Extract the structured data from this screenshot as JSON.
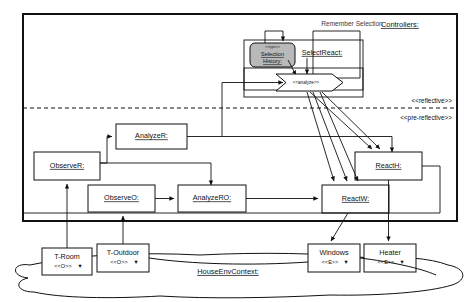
{
  "diagram": {
    "frames": [
      {
        "id": "controllers",
        "label": "Controllers:"
      },
      {
        "id": "house_env",
        "label": "HouseEnvContext:"
      }
    ],
    "layer_labels": [
      {
        "id": "reflective",
        "label": "<<reflective>>"
      },
      {
        "id": "pre_reflective",
        "label": "<<pre-reflective>>"
      }
    ],
    "notes": [
      {
        "id": "remember_selection",
        "label": "Remember Selection"
      }
    ],
    "nodes": [
      {
        "id": "select_react",
        "label": "SelectReact:",
        "stereotype": "",
        "kind": "component"
      },
      {
        "id": "selection_history",
        "label": "Selection History:",
        "line1": "Selection",
        "line2": "History:",
        "stereotype": "<<type>>",
        "kind": "datastore"
      },
      {
        "id": "analyze",
        "label": "<<analyze>>",
        "kind": "arrow-stereotype"
      },
      {
        "id": "analyze_r",
        "label": "AnalyzeR:",
        "kind": "component"
      },
      {
        "id": "observe_r",
        "label": "ObserveR:",
        "kind": "component"
      },
      {
        "id": "observe_o",
        "label": "ObserveO:",
        "kind": "component"
      },
      {
        "id": "analyze_ro",
        "label": "AnalyzeRO:",
        "kind": "component"
      },
      {
        "id": "react_h",
        "label": "ReactH:",
        "kind": "component"
      },
      {
        "id": "react_w",
        "label": "ReactW:",
        "kind": "component"
      },
      {
        "id": "t_room",
        "label": "T-Room",
        "stereotype": "<<O>>",
        "marker": "▼",
        "kind": "environment"
      },
      {
        "id": "t_outdoor",
        "label": "T-Outdoor",
        "stereotype": "<<O>>",
        "marker": "▼",
        "kind": "environment"
      },
      {
        "id": "windows",
        "label": "Windows",
        "stereotype": "<<E>>",
        "marker": "▼",
        "kind": "environment"
      },
      {
        "id": "heater",
        "label": "Heater",
        "stereotype": "<<E>>",
        "marker": "▼",
        "kind": "environment"
      }
    ],
    "edges": [
      {
        "from": "t_room",
        "to": "observe_r"
      },
      {
        "from": "t_outdoor",
        "to": "observe_o"
      },
      {
        "from": "observe_r",
        "to": "analyze_r"
      },
      {
        "from": "observe_r",
        "to": "analyze_ro"
      },
      {
        "from": "observe_o",
        "to": "analyze_ro"
      },
      {
        "from": "analyze_ro",
        "to": "react_w"
      },
      {
        "from": "analyze_r",
        "to": "analyze"
      },
      {
        "from": "analyze_r",
        "to": "react_h"
      },
      {
        "from": "analyze",
        "to": "react_w"
      },
      {
        "from": "analyze",
        "to": "react_h"
      },
      {
        "from": "select_react",
        "to": "analyze"
      },
      {
        "from": "selection_history",
        "to": "analyze"
      },
      {
        "from": "select_react",
        "to": "selection_history"
      },
      {
        "from": "react_w",
        "to": "windows"
      },
      {
        "from": "react_h",
        "to": "heater"
      }
    ],
    "colors": {
      "stroke": "#111111",
      "background": "#ffffff",
      "datastore_fill": "#b9b9b9"
    }
  }
}
